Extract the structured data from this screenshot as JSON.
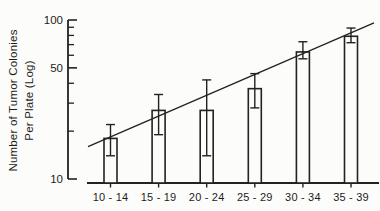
{
  "figure": {
    "background": "#fcfcfa",
    "ink_color": "#222222"
  },
  "y_axis": {
    "title_line1": "Number of Tumor Colonies",
    "title_line2": "Per Plate (Log)",
    "scale": "log",
    "range": [
      10,
      100
    ],
    "major_labels": [
      {
        "value": 100,
        "label": "100"
      },
      {
        "value": 50,
        "label": "50"
      },
      {
        "value": 10,
        "label": "10"
      }
    ],
    "minor_ticks": [
      20,
      30,
      40,
      60,
      70,
      80,
      90
    ]
  },
  "chart_data": {
    "type": "bar",
    "title": "",
    "xlabel": "",
    "ylabel": "Number of Tumor Colonies Per Plate (Log)",
    "y_scale": "log",
    "ylim": [
      10,
      100
    ],
    "grid": false,
    "legend": false,
    "categories": [
      "10 - 14",
      "15 - 19",
      "20 - 24",
      "25 - 29",
      "30 - 34",
      "35 - 39"
    ],
    "values": [
      18,
      27,
      27,
      37,
      63,
      79
    ],
    "error_low": [
      14,
      19,
      14,
      28,
      57,
      72
    ],
    "error_high": [
      22,
      34,
      42,
      46,
      73,
      89
    ],
    "trendline": {
      "start_value": 16,
      "end_value": 96
    }
  }
}
